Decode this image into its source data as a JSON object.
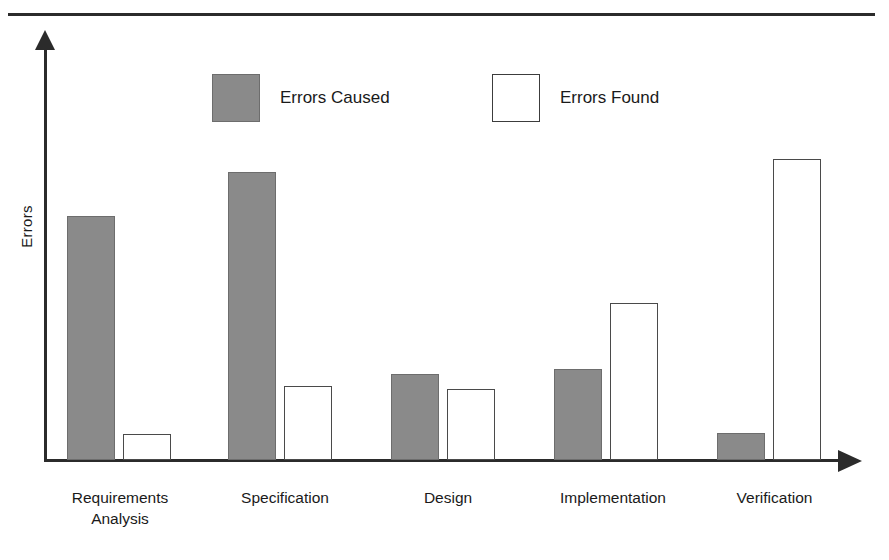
{
  "chart_data": {
    "type": "bar",
    "title": "",
    "xlabel": "",
    "ylabel": "Errors",
    "grid": false,
    "legend_position": "top",
    "axis_style": "arrow-axes-no-ticks",
    "categories": [
      "Requirements\nAnalysis",
      "Specification",
      "Design",
      "Implementation",
      "Verification"
    ],
    "series": [
      {
        "name": "Errors Caused",
        "color": "#8a8a8a",
        "values": [
          244,
          288,
          86,
          91,
          27
        ]
      },
      {
        "name": "Errors Found",
        "color": "#ffffff",
        "values": [
          26,
          74,
          71,
          157,
          301
        ]
      }
    ],
    "ylim": [
      0,
      416
    ],
    "value_units": "relative bar height in pixels (unlabeled axis)"
  },
  "legend": {
    "items": [
      {
        "label": "Errors Caused",
        "swatch": "filled-gray-swatch"
      },
      {
        "label": "Errors Found",
        "swatch": "outlined-white-swatch"
      }
    ]
  },
  "axes": {
    "y_title": "Errors",
    "x_tick_labels": [
      "Requirements\nAnalysis",
      "Specification",
      "Design",
      "Implementation",
      "Verification"
    ]
  },
  "colors": {
    "caused_fill": "#8a8a8a",
    "caused_stroke": "#6d6d6d",
    "found_fill": "#ffffff",
    "found_stroke": "#4a4a4a",
    "axis": "#2b2b2b",
    "text": "#1a1a1a",
    "background": "#ffffff"
  },
  "geometry": {
    "baseline_y": 460,
    "groups": [
      {
        "caused_x": 67,
        "found_x": 123,
        "label_x": 40,
        "label_w": 160
      },
      {
        "caused_x": 228,
        "found_x": 284,
        "label_x": 205,
        "label_w": 160
      },
      {
        "caused_x": 391,
        "found_x": 447,
        "label_x": 368,
        "label_w": 160
      },
      {
        "caused_x": 554,
        "found_x": 610,
        "label_x": 528,
        "label_w": 170
      },
      {
        "caused_x": 717,
        "found_x": 773,
        "label_x": 692,
        "label_w": 165
      }
    ],
    "bar_width": 48
  }
}
